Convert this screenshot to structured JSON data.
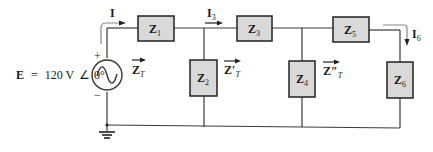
{
  "source": {
    "label_E": "E",
    "equals": "=",
    "value": "120 V",
    "angle_symbol": "∠",
    "phase": "0°",
    "plus": "+",
    "minus": "−"
  },
  "currents": {
    "I": "I",
    "I3": "I",
    "I3_sub": "3",
    "I6": "I",
    "I6_sub": "6"
  },
  "impedances": [
    {
      "name": "Z",
      "sub": "1"
    },
    {
      "name": "Z",
      "sub": "2"
    },
    {
      "name": "Z",
      "sub": "3"
    },
    {
      "name": "Z",
      "sub": "4"
    },
    {
      "name": "Z",
      "sub": "5"
    },
    {
      "name": "Z",
      "sub": "6"
    }
  ],
  "total_impedance_labels": [
    {
      "main": "Z",
      "sub": "T"
    },
    {
      "main": "Z′",
      "sub": "T"
    },
    {
      "main": "Z″",
      "sub": "T"
    }
  ],
  "colors": {
    "box_fill": "#d9d9d9",
    "wire": "#3a3a3a",
    "current_arrow": "#888888"
  }
}
